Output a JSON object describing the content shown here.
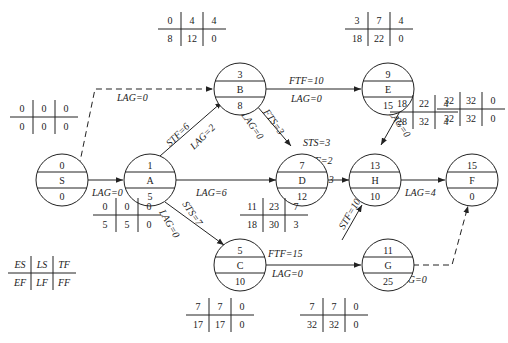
{
  "nodes": [
    {
      "id": "S",
      "cx": 62,
      "cy": 212,
      "top": "0",
      "mid": "S",
      "bot": "0"
    },
    {
      "id": "A",
      "cx": 150,
      "cy": 180,
      "top": "1",
      "mid": "A",
      "bot": "5"
    },
    {
      "id": "B",
      "cx": 240,
      "cy": 80,
      "top": "3",
      "mid": "B",
      "bot": "8"
    },
    {
      "id": "E",
      "cx": 388,
      "cy": 80,
      "top": "9",
      "mid": "E",
      "bot": "15"
    },
    {
      "id": "D",
      "cx": 302,
      "cy": 163,
      "top": "7",
      "mid": "D",
      "bot": "12"
    },
    {
      "id": "H",
      "cx": 375,
      "cy": 165,
      "top": "13",
      "mid": "H",
      "bot": "10"
    },
    {
      "id": "F",
      "cx": 472,
      "cy": 165,
      "top": "15",
      "mid": "F",
      "bot": "0"
    },
    {
      "id": "C",
      "cx": 240,
      "cy": 265,
      "top": "5",
      "mid": "C",
      "bot": "10"
    },
    {
      "id": "G",
      "cx": 388,
      "cy": 265,
      "top": "11",
      "mid": "G",
      "bot": "25"
    }
  ],
  "tables": [
    {
      "for": "S",
      "x": 10,
      "y": 100,
      "r1": [
        "0",
        "0",
        "0"
      ],
      "r2": [
        "0",
        "0",
        "0"
      ]
    },
    {
      "for": "A",
      "x": 93,
      "y": 198,
      "r1": [
        "0",
        "0",
        "0"
      ],
      "r2": [
        "5",
        "5",
        "0"
      ]
    },
    {
      "for": "B",
      "x": 158,
      "y": 12,
      "r1": [
        "0",
        "4",
        "4"
      ],
      "r2": [
        "8",
        "12",
        "0"
      ]
    },
    {
      "for": "E",
      "x": 345,
      "y": 12,
      "r1": [
        "3",
        "7",
        "4"
      ],
      "r2": [
        "18",
        "22",
        "0"
      ]
    },
    {
      "for": "D",
      "x": 240,
      "y": 198,
      "r1": [
        "11",
        "23",
        "7"
      ],
      "r2": [
        "18",
        "30",
        "3"
      ]
    },
    {
      "for": "H",
      "x": 390,
      "y": 95,
      "r1": [
        "18",
        "22",
        "4"
      ],
      "r2": [
        "28",
        "32",
        "4"
      ]
    },
    {
      "for": "F",
      "x": 437,
      "y": 92,
      "r1": [
        "32",
        "32",
        "0"
      ],
      "r2": [
        "32",
        "32",
        "0"
      ]
    },
    {
      "for": "C",
      "x": 186,
      "y": 298,
      "r1": [
        "7",
        "7",
        "0"
      ],
      "r2": [
        "17",
        "17",
        "0"
      ]
    },
    {
      "for": "G",
      "x": 300,
      "y": 298,
      "r1": [
        "7",
        "7",
        "0"
      ],
      "r2": [
        "32",
        "32",
        "0"
      ]
    }
  ],
  "legend": {
    "x": 24,
    "y": 256,
    "r1": [
      "ES",
      "LS",
      "TF"
    ],
    "r2": [
      "EF",
      "LF",
      "FF"
    ]
  },
  "edges": [
    {
      "from": "S",
      "to": "A",
      "labels": [
        "LAG=0"
      ],
      "dashed": false
    },
    {
      "from": "S",
      "to": "B",
      "labels": [
        "LAG=0"
      ],
      "dashed": true
    },
    {
      "from": "A",
      "to": "B",
      "labels": [
        "STF=6",
        "LAG=2"
      ],
      "dashed": false
    },
    {
      "from": "A",
      "to": "D",
      "labels": [
        "LAG=6"
      ],
      "dashed": false
    },
    {
      "from": "A",
      "to": "C",
      "labels": [
        "STS=7",
        "LAG=0"
      ],
      "dashed": false
    },
    {
      "from": "B",
      "to": "E",
      "labels": [
        "FTF=10",
        "LAG=0"
      ],
      "dashed": false
    },
    {
      "from": "B",
      "to": "D",
      "labels": [
        "FTS=3",
        "LAG=0"
      ],
      "dashed": false
    },
    {
      "from": "E",
      "to": "H",
      "labels": [
        "LAG=0"
      ],
      "dashed": false
    },
    {
      "from": "D",
      "to": "H",
      "labels": [
        "STS=3",
        "FTF=2",
        "LAG=3"
      ],
      "dashed": false
    },
    {
      "from": "H",
      "to": "F",
      "labels": [
        "LAG=4"
      ],
      "dashed": false
    },
    {
      "from": "C",
      "to": "G",
      "labels": [
        "FTF=15",
        "LAG=0"
      ],
      "dashed": false
    },
    {
      "from": "G",
      "to": "H",
      "labels": [
        "STF=10"
      ],
      "dashed": false
    },
    {
      "from": "G",
      "to": "F",
      "labels": [
        "LAG=0"
      ],
      "dashed": true
    }
  ]
}
